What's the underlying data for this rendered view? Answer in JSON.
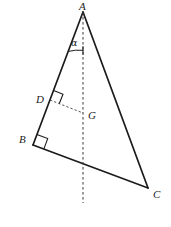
{
  "figure": {
    "kind": "geometry-diagram",
    "canvas": {
      "width": 171,
      "height": 227
    },
    "colors": {
      "background": "#ffffff",
      "stroke": "#1b1b1b",
      "dashed_stroke": "#3a3a3a",
      "label_text": "#1b1b1b"
    },
    "points": [
      {
        "name": "A",
        "label": "A",
        "x": 83,
        "y": 12,
        "label_x": 79,
        "label_y": 1
      },
      {
        "name": "B",
        "label": "B",
        "x": 33,
        "y": 145,
        "label_x": 19,
        "label_y": 134
      },
      {
        "name": "C",
        "label": "C",
        "x": 148,
        "y": 188,
        "label_x": 153,
        "label_y": 189
      },
      {
        "name": "D",
        "label": "D",
        "x": 50,
        "y": 100,
        "label_x": 36,
        "label_y": 94
      },
      {
        "name": "G",
        "label": "G",
        "x": 83,
        "y": 113,
        "label_x": 88,
        "label_y": 110
      }
    ],
    "solid_segments": [
      {
        "name": "side-AB",
        "from": "A",
        "to": "B"
      },
      {
        "name": "side-AC",
        "from": "A",
        "to": "C"
      },
      {
        "name": "side-BC",
        "from": "B",
        "to": "C"
      }
    ],
    "dashed_segments": [
      {
        "name": "axis-A-down",
        "x1": 83,
        "y1": 12,
        "x2": 83,
        "y2": 203
      },
      {
        "name": "segment-DG",
        "x1": 50,
        "y1": 100,
        "x2": 83,
        "y2": 113
      }
    ],
    "right_angles": [
      {
        "name": "right-angle-at-D",
        "at": "D",
        "size": 10
      },
      {
        "name": "right-angle-at-B",
        "at": "B",
        "size": 11
      }
    ],
    "angles": [
      {
        "name": "angle-alpha-at-A",
        "symbol": "α",
        "at": "A",
        "label_x": 71,
        "label_y": 38
      }
    ]
  }
}
